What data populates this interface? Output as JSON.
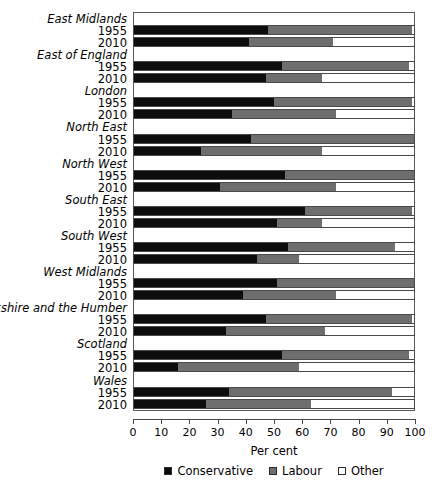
{
  "chart_data": {
    "type": "bar",
    "orientation": "horizontal",
    "stacked": true,
    "title": "",
    "xlabel": "Per cent",
    "ylabel": "",
    "xlim": [
      0,
      100
    ],
    "xticks": [
      0,
      10,
      20,
      30,
      40,
      50,
      60,
      70,
      80,
      90,
      100
    ],
    "grid": false,
    "legend_position": "bottom",
    "legend": [
      "Conservative",
      "Labour",
      "Other"
    ],
    "series": [
      {
        "name": "Conservative",
        "color": "#0d0d0d"
      },
      {
        "name": "Labour",
        "color": "#6e6e6e"
      },
      {
        "name": "Other",
        "color": "#ffffff"
      }
    ],
    "groups": [
      {
        "region": "East Midlands",
        "rows": [
          {
            "year": "1955",
            "Conservative": 48,
            "Labour": 51,
            "Other": 1
          },
          {
            "year": "2010",
            "Conservative": 41,
            "Labour": 30,
            "Other": 29
          }
        ]
      },
      {
        "region": "East of England",
        "rows": [
          {
            "year": "1955",
            "Conservative": 53,
            "Labour": 45,
            "Other": 2
          },
          {
            "year": "2010",
            "Conservative": 47,
            "Labour": 20,
            "Other": 33
          }
        ]
      },
      {
        "region": "London",
        "rows": [
          {
            "year": "1955",
            "Conservative": 50,
            "Labour": 49,
            "Other": 1
          },
          {
            "year": "2010",
            "Conservative": 35,
            "Labour": 37,
            "Other": 28
          }
        ]
      },
      {
        "region": "North East",
        "rows": [
          {
            "year": "1955",
            "Conservative": 42,
            "Labour": 58,
            "Other": 0
          },
          {
            "year": "2010",
            "Conservative": 24,
            "Labour": 43,
            "Other": 33
          }
        ]
      },
      {
        "region": "North West",
        "rows": [
          {
            "year": "1955",
            "Conservative": 54,
            "Labour": 46,
            "Other": 0
          },
          {
            "year": "2010",
            "Conservative": 31,
            "Labour": 41,
            "Other": 28
          }
        ]
      },
      {
        "region": "South East",
        "rows": [
          {
            "year": "1955",
            "Conservative": 61,
            "Labour": 38,
            "Other": 1
          },
          {
            "year": "2010",
            "Conservative": 51,
            "Labour": 16,
            "Other": 33
          }
        ]
      },
      {
        "region": "South West",
        "rows": [
          {
            "year": "1955",
            "Conservative": 55,
            "Labour": 38,
            "Other": 7
          },
          {
            "year": "2010",
            "Conservative": 44,
            "Labour": 15,
            "Other": 41
          }
        ]
      },
      {
        "region": "West Midlands",
        "rows": [
          {
            "year": "1955",
            "Conservative": 51,
            "Labour": 49,
            "Other": 0
          },
          {
            "year": "2010",
            "Conservative": 39,
            "Labour": 33,
            "Other": 28
          }
        ]
      },
      {
        "region": "Yorkshire and the Humber",
        "rows": [
          {
            "year": "1955",
            "Conservative": 47,
            "Labour": 52,
            "Other": 1
          },
          {
            "year": "2010",
            "Conservative": 33,
            "Labour": 35,
            "Other": 32
          }
        ]
      },
      {
        "region": "Scotland",
        "rows": [
          {
            "year": "1955",
            "Conservative": 53,
            "Labour": 45,
            "Other": 2
          },
          {
            "year": "2010",
            "Conservative": 16,
            "Labour": 43,
            "Other": 41
          }
        ]
      },
      {
        "region": "Wales",
        "rows": [
          {
            "year": "1955",
            "Conservative": 34,
            "Labour": 58,
            "Other": 8
          },
          {
            "year": "2010",
            "Conservative": 26,
            "Labour": 37,
            "Other": 37
          }
        ]
      }
    ]
  }
}
